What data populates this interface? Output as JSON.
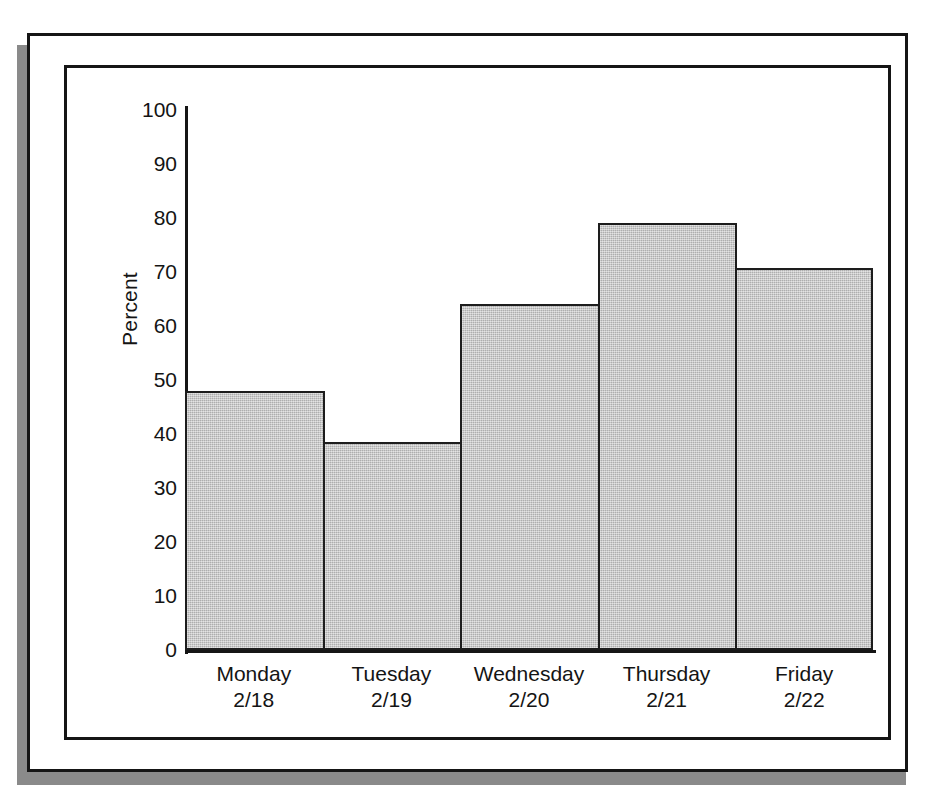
{
  "chart_data": {
    "type": "bar",
    "title": "",
    "xlabel": "",
    "ylabel": "Percent",
    "ylim": [
      0,
      100
    ],
    "yticks": [
      0,
      10,
      20,
      30,
      40,
      50,
      60,
      70,
      80,
      90,
      100
    ],
    "grid": false,
    "legend": null,
    "bar_style": "contiguous-histogram",
    "bar_fill_color": "#c2c2c2",
    "bar_edge_color": "#1d1d1d",
    "categories": [
      "Monday",
      "Tuesday",
      "Wednesday",
      "Thursday",
      "Friday"
    ],
    "category_sublabels": [
      "2/18",
      "2/19",
      "2/20",
      "2/21",
      "2/22"
    ],
    "values": [
      48,
      38.5,
      64,
      79,
      70.7
    ]
  },
  "axis": {
    "y_title": "Percent",
    "y_tick_labels": [
      "100",
      "90",
      "80",
      "70",
      "60",
      "50",
      "40",
      "30",
      "20",
      "10",
      "0"
    ]
  },
  "x_categories": [
    {
      "day": "Monday",
      "date": "2/18"
    },
    {
      "day": "Tuesday",
      "date": "2/19"
    },
    {
      "day": "Wednesday",
      "date": "2/20"
    },
    {
      "day": "Thursday",
      "date": "2/21"
    },
    {
      "day": "Friday",
      "date": "2/22"
    }
  ]
}
